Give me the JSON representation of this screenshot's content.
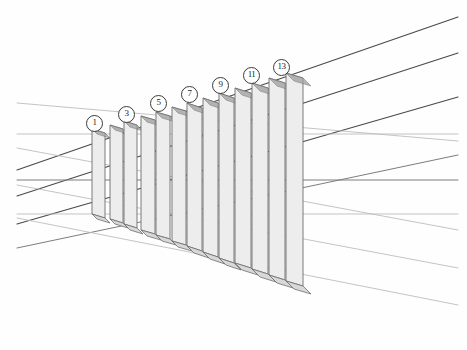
{
  "figure": {
    "background_color": "#fefefe",
    "width": 467,
    "height": 350
  },
  "style": {
    "line_dark": "#4a4a4a",
    "line_mid": "#7d7d7d",
    "line_light": "#b9b9b9",
    "post_fill": "#ededed",
    "post_stroke": "#6e6e6e",
    "base_fill": "#d8d8d8",
    "label_stroke": "#3a3a3a",
    "label_text": "#1d1d1d"
  },
  "labels": [
    {
      "text": "1",
      "x": 86,
      "y": 115
    },
    {
      "text": "3",
      "x": 118,
      "y": 106
    },
    {
      "text": "5",
      "x": 150,
      "y": 95
    },
    {
      "text": "7",
      "x": 181,
      "y": 86
    },
    {
      "text": "9",
      "x": 212,
      "y": 77
    },
    {
      "text": "11",
      "x": 243,
      "y": 67
    },
    {
      "text": "13",
      "x": 273,
      "y": 59
    }
  ],
  "posts": [
    {
      "id": 1,
      "x_left": 92,
      "x_right": 105,
      "y_top": 129,
      "y_bottom": 214,
      "base_drop": 5
    },
    {
      "id": 2,
      "x_left": 110,
      "x_right": 123,
      "y_top": 125,
      "y_bottom": 219,
      "base_drop": 5
    },
    {
      "id": 3,
      "x_left": 124,
      "x_right": 137,
      "y_top": 121,
      "y_bottom": 224,
      "base_drop": 6
    },
    {
      "id": 4,
      "x_left": 141,
      "x_right": 155,
      "y_top": 116,
      "y_bottom": 230,
      "base_drop": 6
    },
    {
      "id": 5,
      "x_left": 156,
      "x_right": 170,
      "y_top": 112,
      "y_bottom": 235,
      "base_drop": 6
    },
    {
      "id": 6,
      "x_left": 172,
      "x_right": 186,
      "y_top": 107,
      "y_bottom": 241,
      "base_drop": 6
    },
    {
      "id": 7,
      "x_left": 187,
      "x_right": 202,
      "y_top": 103,
      "y_bottom": 246,
      "base_drop": 7
    },
    {
      "id": 8,
      "x_left": 203,
      "x_right": 218,
      "y_top": 98,
      "y_bottom": 252,
      "base_drop": 7
    },
    {
      "id": 9,
      "x_left": 219,
      "x_right": 234,
      "y_top": 93,
      "y_bottom": 258,
      "base_drop": 7
    },
    {
      "id": 10,
      "x_left": 235,
      "x_right": 251,
      "y_top": 88,
      "y_bottom": 263,
      "base_drop": 7
    },
    {
      "id": 11,
      "x_left": 252,
      "x_right": 268,
      "y_top": 83,
      "y_bottom": 269,
      "base_drop": 8
    },
    {
      "id": 12,
      "x_left": 269,
      "x_right": 285,
      "y_top": 78,
      "y_bottom": 275,
      "base_drop": 8
    },
    {
      "id": 13,
      "x_left": 286,
      "x_right": 303,
      "y_top": 73,
      "y_bottom": 281,
      "base_drop": 8
    }
  ],
  "construction_lines": [
    {
      "name": "ascending-top-outer",
      "x1": 17,
      "y1": 170,
      "x2": 458,
      "y2": 17,
      "shade": "dark"
    },
    {
      "name": "ascending-upper",
      "x1": 17,
      "y1": 196,
      "x2": 458,
      "y2": 53,
      "shade": "dark"
    },
    {
      "name": "ascending-mid",
      "x1": 17,
      "y1": 224,
      "x2": 458,
      "y2": 97,
      "shade": "dark"
    },
    {
      "name": "ascending-lower",
      "x1": 17,
      "y1": 248,
      "x2": 458,
      "y2": 155,
      "shade": "mid"
    },
    {
      "name": "horizontal-upper",
      "x1": 17,
      "y1": 134,
      "x2": 458,
      "y2": 134,
      "shade": "light"
    },
    {
      "name": "horizontal-center",
      "x1": 17,
      "y1": 180,
      "x2": 458,
      "y2": 180,
      "shade": "mid"
    },
    {
      "name": "horizontal-lower",
      "x1": 17,
      "y1": 214,
      "x2": 458,
      "y2": 214,
      "shade": "light"
    },
    {
      "name": "descending-top",
      "x1": 17,
      "y1": 103,
      "x2": 458,
      "y2": 141,
      "shade": "light"
    },
    {
      "name": "descending-upper",
      "x1": 17,
      "y1": 148,
      "x2": 458,
      "y2": 230,
      "shade": "light"
    },
    {
      "name": "descending-mid",
      "x1": 17,
      "y1": 185,
      "x2": 458,
      "y2": 268,
      "shade": "light"
    },
    {
      "name": "descending-lower",
      "x1": 17,
      "y1": 218,
      "x2": 458,
      "y2": 305,
      "shade": "light"
    }
  ],
  "vanishing_points": [
    {
      "name": "upper-vp",
      "x": 93,
      "y": 130
    },
    {
      "name": "lower-vp",
      "x": 93,
      "y": 180
    }
  ]
}
